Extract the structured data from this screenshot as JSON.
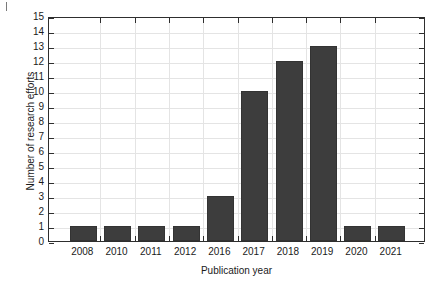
{
  "chart_data": {
    "type": "bar",
    "title": "",
    "xlabel": "Publication year",
    "ylabel": "Number of research efforts",
    "categories": [
      "2008",
      "2010",
      "2011",
      "2012",
      "2016",
      "2017",
      "2018",
      "2019",
      "2020",
      "2021"
    ],
    "values": [
      1,
      1,
      1,
      1,
      3,
      10,
      12,
      13,
      1,
      1
    ],
    "ylim": [
      0,
      15
    ],
    "ytick_step": 1,
    "yticks": [
      "15",
      "14",
      "13",
      "12",
      "11",
      "10",
      "9",
      "8",
      "7",
      "6",
      "5",
      "4",
      "3",
      "2",
      "1",
      "0"
    ],
    "grid": true,
    "grid_axes": "both",
    "legend": null,
    "legend_position": "none",
    "bar_color": "#3d3d3d",
    "grid_color": "#e4e4e4",
    "axis_color": "#2e2e2e",
    "background_color": "#ffffff"
  },
  "figure": {
    "axis_title_x": "Publication year",
    "axis_title_y": "Number of research efforts"
  }
}
